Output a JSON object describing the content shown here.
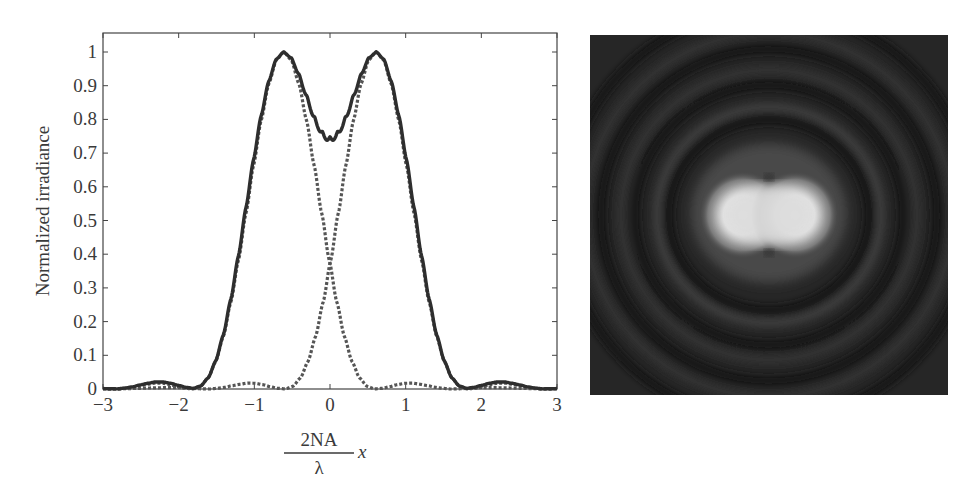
{
  "chart_data": [
    {
      "type": "line",
      "title": "",
      "xlabel": "2NA/λ x",
      "xlabel_parts": {
        "numerator": "2NA",
        "denominator": "λ",
        "variable": "x"
      },
      "ylabel": "Normalized irradiance",
      "xlim": [
        -3,
        3
      ],
      "ylim": [
        0,
        1.05
      ],
      "xticks": [
        -3,
        -2,
        -1,
        0,
        1,
        2,
        3
      ],
      "xtick_labels": [
        "−3",
        "−2",
        "−1",
        "0",
        "1",
        "2",
        "3"
      ],
      "yticks": [
        0,
        0.1,
        0.2,
        0.3,
        0.4,
        0.5,
        0.6,
        0.7,
        0.8,
        0.9,
        1
      ],
      "ytick_labels": [
        "0",
        "0.1",
        "0.2",
        "0.3",
        "0.4",
        "0.5",
        "0.6",
        "0.7",
        "0.8",
        "0.9",
        "1"
      ],
      "grid": false,
      "legend": null,
      "description": "Two Airy irradiance profiles separated by the Rayleigh distance (dotted) and their sum (solid)",
      "airy_profile": {
        "u": [
          0,
          0.1,
          0.2,
          0.3,
          0.4,
          0.5,
          0.6,
          0.7,
          0.8,
          0.9,
          1.0,
          1.1,
          1.2,
          1.3,
          1.4,
          1.5,
          1.6,
          1.7,
          1.8,
          1.9,
          2.0,
          2.1,
          2.2,
          2.3,
          2.4,
          2.5,
          2.6,
          2.7,
          2.8,
          2.9,
          3.0,
          3.2,
          3.4,
          3.6,
          4.0
        ],
        "I": [
          1,
          0.976,
          0.905,
          0.797,
          0.664,
          0.522,
          0.382,
          0.258,
          0.156,
          0.082,
          0.033,
          0.008,
          0.0002,
          0.002,
          0.007,
          0.013,
          0.017,
          0.0175,
          0.014,
          0.01,
          0.005,
          0.002,
          0.0,
          0.0005,
          0.0015,
          0.003,
          0.004,
          0.0042,
          0.004,
          0.0035,
          0.003,
          0.0015,
          0.0005,
          0.0,
          0.0
        ]
      },
      "series": [
        {
          "name": "PSF left",
          "style": "dotted",
          "center": -0.61,
          "color": "#555555"
        },
        {
          "name": "PSF right",
          "style": "dotted",
          "center": 0.61,
          "color": "#555555"
        },
        {
          "name": "Sum",
          "style": "solid",
          "color": "#2e2e2e",
          "peak_values": {
            "x": [
              -0.61,
              0.61
            ],
            "y": [
              1.0,
              1.0
            ]
          },
          "dip_at_zero": 0.735
        }
      ],
      "crossing_value": 0.37
    },
    {
      "type": "image",
      "description": "Simulated 2D irradiance image of two point sources at Rayleigh resolution showing merged central lobes and concentric Airy rings",
      "background": "#1e1e1e",
      "lobe_color": "#f2f2f2"
    }
  ]
}
